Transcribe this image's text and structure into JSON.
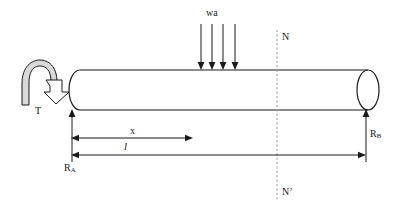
{
  "figure": {
    "type": "engineering-free-body-diagram",
    "colors": {
      "stroke": "#1a1a1a",
      "background": "#ffffff",
      "torque_fill": "#d9d9d9",
      "dashed_line": "#9a9a9a"
    },
    "labels": {
      "distributed_load": "wa",
      "torque": "T",
      "reaction_left": "R",
      "reaction_left_sub": "A",
      "reaction_right": "R",
      "reaction_right_sub": "B",
      "section_top": "N",
      "section_bottom": "N’",
      "dimension_x": "x",
      "dimension_length": "l"
    },
    "geometry": {
      "beam_left_x": 72,
      "beam_right_x": 368,
      "beam_top_y": 70,
      "beam_bottom_y": 110,
      "section_line_x": 277,
      "dimension_x_end": 192,
      "load_arrow_count": 4
    }
  }
}
